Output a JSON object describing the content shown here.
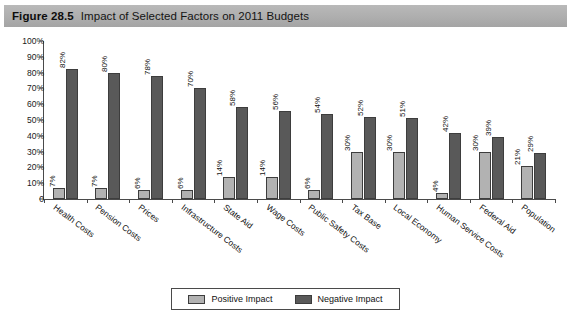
{
  "figure": {
    "number": "Figure 28.5",
    "title": "Impact of Selected Factors on 2011 Budgets"
  },
  "legend": {
    "position": "bottom-center",
    "items": [
      {
        "label": "Positive Impact",
        "color": "#b2b2b2",
        "swatch": "positive-impact-swatch"
      },
      {
        "label": "Negative Impact",
        "color": "#595959",
        "swatch": "negative-impact-swatch"
      }
    ]
  },
  "axis": {
    "y_ticks": [
      "100%",
      "90%",
      "80%",
      "70%",
      "60%",
      "50%",
      "40%",
      "30%",
      "20%",
      "10%",
      "0"
    ]
  },
  "chart_data": {
    "type": "bar",
    "title": "Impact of Selected Factors on 2011 Budgets",
    "xlabel": "",
    "ylabel": "",
    "ylim": [
      0,
      100
    ],
    "ytick_values": [
      0,
      10,
      20,
      30,
      40,
      50,
      60,
      70,
      80,
      90,
      100
    ],
    "ytick_labels": [
      "0",
      "10%",
      "20%",
      "30%",
      "40%",
      "50%",
      "60%",
      "70%",
      "80%",
      "90%",
      "100%"
    ],
    "grid": false,
    "legend_position": "bottom-center",
    "categories": [
      "Health Costs",
      "Pension Costs",
      "Prices",
      "Infrastructure Costs",
      "State Aid",
      "Wage Costs",
      "Public Safety Costs",
      "Tax Base",
      "Local Economy",
      "Human Service Costs",
      "Federal Aid",
      "Population"
    ],
    "series": [
      {
        "name": "Positive Impact",
        "color": "#b2b2b2",
        "values": [
          7,
          7,
          6,
          6,
          14,
          14,
          6,
          30,
          30,
          4,
          30,
          21
        ],
        "labels": [
          "7%",
          "7%",
          "6%",
          "6%",
          "14%",
          "14%",
          "6%",
          "30%",
          "30%",
          "4%",
          "30%",
          "21%"
        ]
      },
      {
        "name": "Negative Impact",
        "color": "#595959",
        "values": [
          82,
          80,
          78,
          70,
          58,
          56,
          54,
          52,
          51,
          42,
          39,
          29
        ],
        "labels": [
          "82%",
          "80%",
          "78%",
          "70%",
          "58%",
          "56%",
          "54%",
          "52%",
          "51%",
          "42%",
          "39%",
          "29%"
        ]
      }
    ]
  }
}
